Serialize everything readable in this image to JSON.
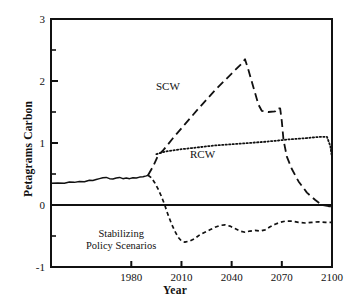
{
  "chart_data": {
    "type": "line",
    "title": "",
    "subtitle": "",
    "xlabel": "Year",
    "ylabel": "Petagrams Carbon",
    "xlim": [
      1932,
      2100
    ],
    "ylim": [
      -1,
      3
    ],
    "xticks": [
      1980,
      2010,
      2040,
      2070,
      2100
    ],
    "xtick_labels": [
      "1980",
      "2010",
      "2040",
      "2070",
      "2100"
    ],
    "yticks": [
      -1,
      0,
      1,
      2,
      3
    ],
    "ytick_labels": [
      "-1",
      "0",
      "1",
      "2",
      "3"
    ],
    "yminorticks": [
      -0.5,
      0.5,
      1.5,
      2.5
    ],
    "grid": false,
    "legend_position": "inline-annotations",
    "zero_line": 0,
    "annotations": [
      {
        "name": "scw-label",
        "text": "SCW",
        "x": 2003,
        "y": 1.72
      },
      {
        "name": "rcw-label",
        "text": "RCW",
        "x": 2021,
        "y": 0.62
      },
      {
        "name": "stabilizing-label",
        "line1": "Stabilizing",
        "line2": "Policy Scenarios",
        "x": 1988,
        "y": -0.68
      }
    ],
    "series": [
      {
        "name": "Historical",
        "style": "solid",
        "points": [
          [
            1932,
            0.35
          ],
          [
            1936,
            0.355
          ],
          [
            1940,
            0.35
          ],
          [
            1943,
            0.37
          ],
          [
            1946,
            0.365
          ],
          [
            1949,
            0.38
          ],
          [
            1952,
            0.375
          ],
          [
            1955,
            0.4
          ],
          [
            1957,
            0.395
          ],
          [
            1959,
            0.41
          ],
          [
            1961,
            0.425
          ],
          [
            1963,
            0.44
          ],
          [
            1965,
            0.445
          ],
          [
            1967,
            0.425
          ],
          [
            1969,
            0.42
          ],
          [
            1971,
            0.435
          ],
          [
            1973,
            0.445
          ],
          [
            1975,
            0.425
          ],
          [
            1977,
            0.435
          ],
          [
            1979,
            0.425
          ],
          [
            1981,
            0.44
          ],
          [
            1983,
            0.435
          ],
          [
            1985,
            0.45
          ],
          [
            1987,
            0.455
          ],
          [
            1989,
            0.47
          ],
          [
            1990,
            0.48
          ]
        ]
      },
      {
        "name": "SCW",
        "style": "long-dash",
        "points": [
          [
            1990,
            0.48
          ],
          [
            1993,
            0.62
          ],
          [
            1996,
            0.8
          ],
          [
            1999,
            0.88
          ],
          [
            2005,
            1.08
          ],
          [
            2012,
            1.3
          ],
          [
            2020,
            1.55
          ],
          [
            2030,
            1.85
          ],
          [
            2040,
            2.12
          ],
          [
            2046,
            2.28
          ],
          [
            2048,
            2.35
          ],
          [
            2050,
            2.18
          ],
          [
            2053,
            1.9
          ],
          [
            2056,
            1.62
          ],
          [
            2058,
            1.52
          ],
          [
            2062,
            1.5
          ],
          [
            2066,
            1.51
          ],
          [
            2067,
            1.56
          ],
          [
            2069,
            1.56
          ],
          [
            2070,
            1.35
          ],
          [
            2071,
            1.05
          ],
          [
            2073,
            0.78
          ],
          [
            2076,
            0.58
          ],
          [
            2080,
            0.38
          ],
          [
            2085,
            0.2
          ],
          [
            2090,
            0.08
          ],
          [
            2094,
            0.0
          ],
          [
            2098,
            -0.02
          ],
          [
            2100,
            -0.02
          ]
        ]
      },
      {
        "name": "RCW",
        "style": "dotted",
        "points": [
          [
            1995,
            0.82
          ],
          [
            2000,
            0.86
          ],
          [
            2010,
            0.9
          ],
          [
            2020,
            0.93
          ],
          [
            2030,
            0.96
          ],
          [
            2040,
            0.98
          ],
          [
            2050,
            1.0
          ],
          [
            2060,
            1.02
          ],
          [
            2068,
            1.04
          ],
          [
            2075,
            1.06
          ],
          [
            2085,
            1.08
          ],
          [
            2093,
            1.1
          ],
          [
            2097,
            1.1
          ],
          [
            2099,
            0.95
          ],
          [
            2100,
            0.76
          ]
        ]
      },
      {
        "name": "Stabilizing Policy Scenarios",
        "style": "short-dash",
        "points": [
          [
            1990,
            0.48
          ],
          [
            1992,
            0.44
          ],
          [
            1994,
            0.36
          ],
          [
            1996,
            0.26
          ],
          [
            1998,
            0.14
          ],
          [
            2000,
            0.0
          ],
          [
            2002,
            -0.16
          ],
          [
            2004,
            -0.3
          ],
          [
            2006,
            -0.42
          ],
          [
            2008,
            -0.52
          ],
          [
            2010,
            -0.58
          ],
          [
            2012,
            -0.6
          ],
          [
            2015,
            -0.58
          ],
          [
            2018,
            -0.54
          ],
          [
            2021,
            -0.48
          ],
          [
            2024,
            -0.44
          ],
          [
            2027,
            -0.4
          ],
          [
            2030,
            -0.36
          ],
          [
            2033,
            -0.33
          ],
          [
            2036,
            -0.32
          ],
          [
            2039,
            -0.34
          ],
          [
            2042,
            -0.38
          ],
          [
            2045,
            -0.42
          ],
          [
            2048,
            -0.44
          ],
          [
            2051,
            -0.42
          ],
          [
            2054,
            -0.41
          ],
          [
            2057,
            -0.42
          ],
          [
            2060,
            -0.4
          ],
          [
            2063,
            -0.35
          ],
          [
            2066,
            -0.31
          ],
          [
            2069,
            -0.28
          ],
          [
            2072,
            -0.26
          ],
          [
            2076,
            -0.26
          ],
          [
            2080,
            -0.28
          ],
          [
            2084,
            -0.29
          ],
          [
            2088,
            -0.28
          ],
          [
            2092,
            -0.27
          ],
          [
            2096,
            -0.28
          ],
          [
            2100,
            -0.28
          ]
        ]
      }
    ],
    "colors": {
      "axis": "#111111",
      "historical": "#111111",
      "scw": "#111111",
      "rcw": "#111111",
      "stabilizing": "#111111",
      "background": "#ffffff"
    }
  }
}
